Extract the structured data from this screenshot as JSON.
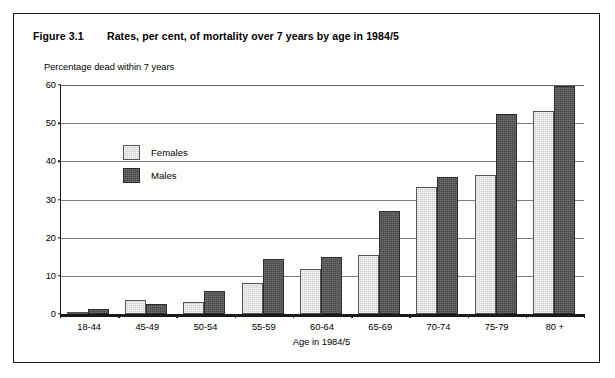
{
  "figure": {
    "number": "Figure 3.1",
    "title": "Rates, per cent, of mortality over 7 years by age in 1984/5"
  },
  "chart_data": {
    "type": "bar",
    "title": "Rates, per cent, of mortality over 7 years by age in 1984/5",
    "subtitle": "Percentage dead within 7 years",
    "xlabel": "Age in 1984/5",
    "ylabel": "Percentage dead within 7 years",
    "ylim": [
      0,
      60
    ],
    "yticks": [
      0,
      10,
      20,
      30,
      40,
      50,
      60
    ],
    "grid": true,
    "legend_position": "inside-upper-left",
    "categories": [
      "18-44",
      "45-49",
      "50-54",
      "55-59",
      "60-64",
      "65-69",
      "70-74",
      "75-79",
      "80 +"
    ],
    "series": [
      {
        "name": "Females",
        "color": "#d0d0d0",
        "values": [
          0.6,
          3.8,
          3.2,
          8.0,
          11.8,
          15.4,
          33.2,
          36.5,
          53.2
        ]
      },
      {
        "name": "Males",
        "color": "#474747",
        "values": [
          1.3,
          2.7,
          6.0,
          14.4,
          15.0,
          26.9,
          36.0,
          52.4,
          59.8
        ]
      }
    ]
  }
}
